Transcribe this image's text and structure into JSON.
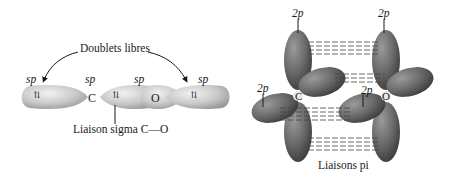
{
  "left_panel": {
    "lone_pairs_label": "Doublets libres",
    "sigma_bond_label": "Liaison sigma C—O",
    "hybrid_labels": [
      "sp",
      "sp",
      "sp",
      "sp"
    ],
    "atom_c": "C",
    "atom_o": "O",
    "electron_pair_symbol": "⇅"
  },
  "right_panel": {
    "orbital_labels": [
      "2p",
      "2p",
      "2p",
      "2p"
    ],
    "atom_c": "C",
    "atom_o": "O",
    "pi_bonds_label": "Liaisons pi"
  },
  "colors": {
    "sp_orbital": "#c8c8c8",
    "p_orbital": "#6e6e6e",
    "text": "#1a1a1a",
    "background": "#ffffff"
  }
}
